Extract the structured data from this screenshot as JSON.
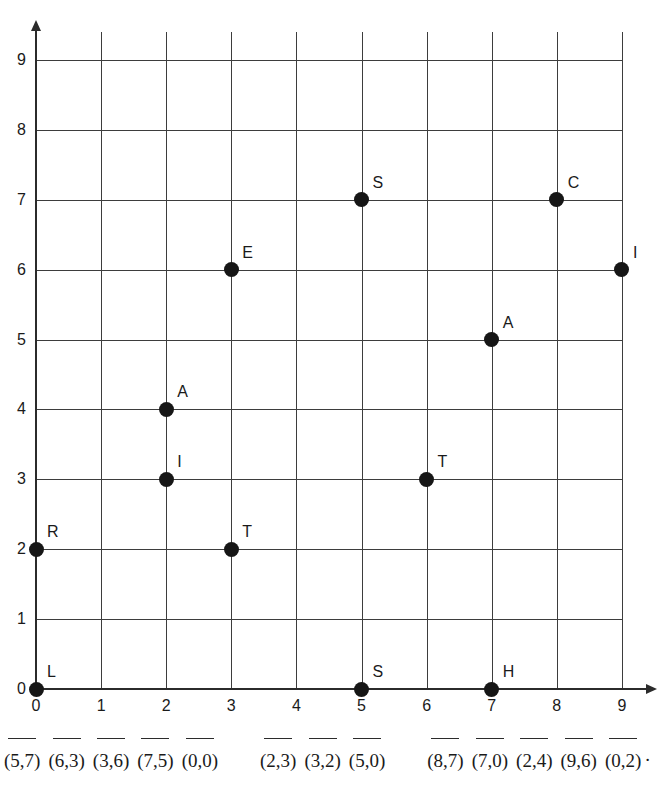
{
  "chart_data": {
    "type": "scatter",
    "title": "",
    "xlabel": "",
    "ylabel": "",
    "xlim": [
      0,
      9
    ],
    "ylim": [
      0,
      9
    ],
    "grid": true,
    "legend": "none",
    "x_ticks": [
      "0",
      "1",
      "2",
      "3",
      "4",
      "5",
      "6",
      "7",
      "8",
      "9"
    ],
    "y_ticks": [
      "0",
      "1",
      "2",
      "3",
      "4",
      "5",
      "6",
      "7",
      "8",
      "9"
    ],
    "points": [
      {
        "label": "L",
        "x": 0,
        "y": 0
      },
      {
        "label": "R",
        "x": 0,
        "y": 2
      },
      {
        "label": "I",
        "x": 2,
        "y": 3
      },
      {
        "label": "A",
        "x": 2,
        "y": 4
      },
      {
        "label": "T",
        "x": 3,
        "y": 2
      },
      {
        "label": "E",
        "x": 3,
        "y": 6
      },
      {
        "label": "S",
        "x": 5,
        "y": 0
      },
      {
        "label": "S",
        "x": 5,
        "y": 7
      },
      {
        "label": "T",
        "x": 6,
        "y": 3
      },
      {
        "label": "H",
        "x": 7,
        "y": 0
      },
      {
        "label": "A",
        "x": 7,
        "y": 5
      },
      {
        "label": "C",
        "x": 8,
        "y": 7
      },
      {
        "label": "I",
        "x": 9,
        "y": 6
      }
    ]
  },
  "answers": {
    "groups": [
      [
        "(5,7)",
        "(6,3)",
        "(3,6)",
        "(7,5)",
        "(0,0)"
      ],
      [
        "(2,3)",
        "(3,2)",
        "(5,0)"
      ],
      [
        "(8,7)",
        "(7,0)",
        "(2,4)",
        "(9,6)",
        "(0,2)"
      ]
    ],
    "terminator": "."
  },
  "colors": {
    "point": "#161616",
    "grid": "#3d3d3d",
    "axis": "#2b2b2b",
    "text": "#1a1a1a",
    "background": "#ffffff"
  }
}
